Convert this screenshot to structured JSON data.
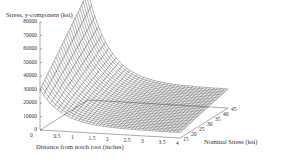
{
  "chart_data": {
    "type": "surface3d",
    "title": "Stress, y-component (ksi)",
    "xlabel": "Distance from notch root (inches)",
    "zlabel_axis": "Nominal Stress (ksi)",
    "ylabel": "Stress, y-component (ksi)",
    "y_ticks": [
      "80000",
      "70000",
      "60000",
      "50000",
      "40000",
      "30000",
      "20000",
      "10000",
      "0"
    ],
    "x_ticks": [
      "0",
      "0.5",
      "1",
      "1.5",
      "2",
      "2.5",
      "3",
      "3.5",
      "4"
    ],
    "nominal_ticks": [
      "15",
      "20",
      "25",
      "30",
      "35",
      "40",
      "45"
    ],
    "ylim": [
      0,
      80000
    ],
    "xlim": [
      0,
      4
    ],
    "nominal_lim": [
      15,
      45
    ],
    "grid": false,
    "series": [
      {
        "name": "Nominal 15",
        "x": [
          0,
          0.5,
          1,
          1.5,
          2,
          2.5,
          3,
          3.5,
          4
        ],
        "values": [
          30000,
          14000,
          8000,
          6000,
          5000,
          4500,
          4000,
          4000,
          4000
        ]
      },
      {
        "name": "Nominal 30",
        "x": [
          0,
          0.5,
          1,
          1.5,
          2,
          2.5,
          3,
          3.5,
          4
        ],
        "values": [
          55000,
          28000,
          17000,
          13000,
          11000,
          10000,
          9500,
          9000,
          9000
        ]
      },
      {
        "name": "Nominal 45",
        "x": [
          0,
          0.5,
          1,
          1.5,
          2,
          2.5,
          3,
          3.5,
          4
        ],
        "values": [
          80000,
          42000,
          26000,
          20000,
          17000,
          15500,
          14500,
          14000,
          14000
        ]
      }
    ]
  },
  "labels": {
    "title": "Stress, y-component (ksi)",
    "xlabel": "Distance from notch root (inches)",
    "zlabel": "Nominal Stress (ksi)",
    "origin_zero": "0"
  }
}
